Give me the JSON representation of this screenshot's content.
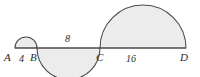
{
  "figure": {
    "colors": {
      "fill": "#ececec",
      "stroke": "#4a4a4a",
      "baseline": "#4a4a4a",
      "text": "#2b2b2b",
      "background": "#ffffff"
    },
    "baseline": {
      "label": "baseline-AD",
      "x_start": 15,
      "x_end": 186,
      "y": 48
    },
    "points": [
      {
        "key": "A",
        "label": "A",
        "x": 15
      },
      {
        "key": "B",
        "label": "B",
        "x": 37
      },
      {
        "key": "C",
        "label": "C",
        "x": 100
      },
      {
        "key": "D",
        "label": "D",
        "x": 186
      }
    ],
    "segments": [
      {
        "key": "AB",
        "label": "4",
        "length": 4,
        "side": "above",
        "from": "A",
        "to": "B"
      },
      {
        "key": "BC",
        "label": "8",
        "length": 8,
        "side": "below",
        "from": "B",
        "to": "C"
      },
      {
        "key": "CD",
        "label": "16",
        "length": 16,
        "side": "above",
        "from": "C",
        "to": "D"
      }
    ],
    "semicircles": [
      {
        "key": "AB",
        "side": "above",
        "cx": 26,
        "r": 11
      },
      {
        "key": "BC",
        "side": "below",
        "cx": 68.5,
        "r": 31.5
      },
      {
        "key": "CD",
        "side": "above",
        "cx": 143,
        "r": 43
      }
    ]
  }
}
